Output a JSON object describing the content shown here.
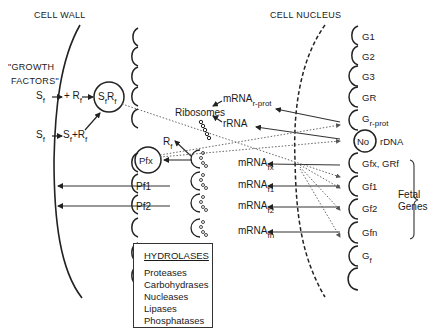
{
  "labels": {
    "cell_wall": "CELL WALL",
    "cell_nucleus": "CELL NUCLEUS",
    "growth_factors_line1": "\"GROWTH",
    "growth_factors_line2": "FACTORS\"",
    "sf": "S",
    "f": "f",
    "rf": "R",
    "plus_rf": "+ R",
    "sf_plus": "S",
    "sfrf_complex_s": "S",
    "sfrf_complex_r": "R",
    "ribosomes": "Ribosomes",
    "mrna": "mRNA",
    "rprot_sub": "r-prot",
    "rrna": "rRNA",
    "pfx": "Pfx",
    "pf1": "Pf1",
    "pf2": "Pf2",
    "rdna": "rDNA",
    "fetal_line1": "Fetal",
    "fetal_line2": "Genes"
  },
  "mrna_rows": [
    {
      "label": "mRNA",
      "sub": "fx"
    },
    {
      "label": "mRNA",
      "sub": "f1"
    },
    {
      "label": "mRNA",
      "sub": "f2"
    },
    {
      "label": "mRNA",
      "sub": "fn"
    }
  ],
  "genes": [
    {
      "label": "G1"
    },
    {
      "label": "G2"
    },
    {
      "label": "G3"
    },
    {
      "label": "GR"
    },
    {
      "label": "G",
      "sub": "r-prot"
    },
    {
      "label": "No"
    },
    {
      "label": "Gfx,  GRf"
    },
    {
      "label": "Gf1"
    },
    {
      "label": "Gf2"
    },
    {
      "label": "Gfn"
    },
    {
      "label": "G",
      "sub": "f"
    }
  ],
  "hydrolases": {
    "title": "HYDROLASES",
    "items": [
      "Proteases",
      "Carbohydrases",
      "Nucleases",
      "Lipases",
      "Phosphatases"
    ]
  }
}
